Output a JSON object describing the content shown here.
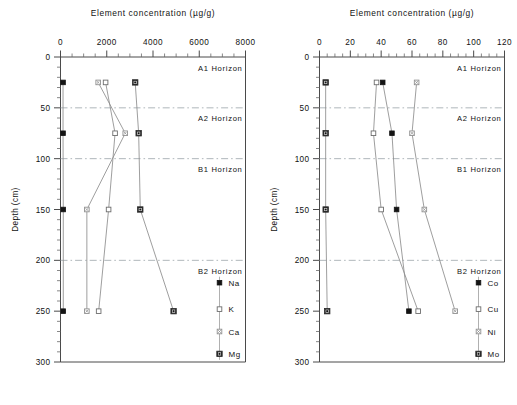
{
  "figure": {
    "panels": [
      {
        "id": "major-elements",
        "axis_title": "Element concentration (µg/g)",
        "x_label": "Element concentration (µg/g)",
        "y_label": "Depth (cm)",
        "x_ticks": [
          "0",
          "2000",
          "4000",
          "6000",
          "8000"
        ],
        "x_tick_values": [
          0,
          2000,
          4000,
          6000,
          8000
        ],
        "x_minor_step": 500,
        "y_ticks": [
          "0",
          "50",
          "100",
          "150",
          "200",
          "250",
          "300"
        ],
        "y_tick_values": [
          0,
          50,
          100,
          150,
          200,
          250,
          300
        ],
        "y_minor_step": 10,
        "xlim": [
          0,
          8000
        ],
        "ylim": [
          0,
          300
        ],
        "horizons": [
          {
            "label": "A1 Horizon",
            "top": 0,
            "bottom": 50,
            "line_at": 50
          },
          {
            "label": "A2 Horizon",
            "top": 50,
            "bottom": 100,
            "line_at": 100
          },
          {
            "label": "B1 Horizon",
            "top": 100,
            "bottom": 200,
            "line_at": 200
          },
          {
            "label": "B2 Horizon",
            "top": 200,
            "bottom": 300,
            "line_at": null
          }
        ],
        "legend": [
          {
            "label": "Na",
            "marker": "filled-square",
            "depth": 222
          },
          {
            "label": "K",
            "marker": "open-square",
            "depth": 248
          },
          {
            "label": "Ca",
            "marker": "dotted-square",
            "depth": 270
          },
          {
            "label": "Mg",
            "marker": "ring-square",
            "depth": 292
          }
        ],
        "series": [
          {
            "name": "Na",
            "marker": "filled-square",
            "depths": [
              25,
              75,
              150,
              250
            ],
            "values": [
              110,
              110,
              120,
              120
            ]
          },
          {
            "name": "K",
            "marker": "open-square",
            "depths": [
              25,
              75,
              150,
              250
            ],
            "values": [
              1950,
              2360,
              2080,
              1650
            ]
          },
          {
            "name": "Ca",
            "marker": "dotted-square",
            "depths": [
              25,
              75,
              150,
              250
            ],
            "values": [
              1630,
              2800,
              1140,
              1140
            ]
          },
          {
            "name": "Mg",
            "marker": "ring-square",
            "depths": [
              25,
              75,
              150,
              250
            ],
            "values": [
              3230,
              3380,
              3450,
              4890
            ]
          }
        ]
      },
      {
        "id": "trace-elements",
        "axis_title": "Element concentration (µg/g)",
        "x_label": "Element concentration (µg/g)",
        "y_label": "Depth (cm)",
        "x_ticks": [
          "0",
          "20",
          "40",
          "60",
          "80",
          "100",
          "120"
        ],
        "x_tick_values": [
          0,
          20,
          40,
          60,
          80,
          100,
          120
        ],
        "x_minor_step": 5,
        "y_ticks": [
          "0",
          "50",
          "100",
          "150",
          "200",
          "250",
          "300"
        ],
        "y_tick_values": [
          0,
          50,
          100,
          150,
          200,
          250,
          300
        ],
        "y_minor_step": 10,
        "xlim": [
          0,
          120
        ],
        "ylim": [
          0,
          300
        ],
        "horizons": [
          {
            "label": "A1 Horizon",
            "top": 0,
            "bottom": 50,
            "line_at": 50
          },
          {
            "label": "A2 Horizon",
            "top": 50,
            "bottom": 100,
            "line_at": 100
          },
          {
            "label": "B1 Horizon",
            "top": 100,
            "bottom": 200,
            "line_at": 200
          },
          {
            "label": "B2 Horizon",
            "top": 200,
            "bottom": 300,
            "line_at": null
          }
        ],
        "legend": [
          {
            "label": "Co",
            "marker": "filled-square",
            "depth": 222
          },
          {
            "label": "Cu",
            "marker": "open-square",
            "depth": 248
          },
          {
            "label": "Ni",
            "marker": "dotted-square",
            "depth": 270
          },
          {
            "label": "Mo",
            "marker": "ring-square",
            "depth": 292
          }
        ],
        "series": [
          {
            "name": "Co",
            "marker": "filled-square",
            "depths": [
              25,
              75,
              150,
              250
            ],
            "values": [
              41,
              47,
              50,
              58
            ]
          },
          {
            "name": "Cu",
            "marker": "open-square",
            "depths": [
              25,
              75,
              150,
              250
            ],
            "values": [
              37,
              35,
              40,
              64
            ]
          },
          {
            "name": "Ni",
            "marker": "dotted-square",
            "depths": [
              25,
              75,
              150,
              250
            ],
            "values": [
              63,
              60,
              68,
              88
            ]
          },
          {
            "name": "Mo",
            "marker": "ring-square",
            "depths": [
              25,
              75,
              150,
              250
            ],
            "values": [
              4,
              4,
              4,
              5
            ]
          }
        ]
      }
    ]
  },
  "chart_data": [
    {
      "type": "line",
      "title": "Element concentration (µg/g)",
      "xlabel": "Element concentration (µg/g)",
      "ylabel": "Depth (cm)",
      "xlim": [
        0,
        8000
      ],
      "ylim": [
        0,
        300
      ],
      "y_inverted": true,
      "grid": false,
      "legend_position": "bottom-right",
      "x": [
        25,
        75,
        150,
        250
      ],
      "x_tick_labels": [
        "0",
        "2000",
        "4000",
        "6000",
        "8000"
      ],
      "y_tick_labels": [
        "0",
        "50",
        "100",
        "150",
        "200",
        "250",
        "300"
      ],
      "annotations": [
        "A1 Horizon",
        "A2 Horizon",
        "B1 Horizon",
        "B2 Horizon"
      ],
      "series": [
        {
          "name": "Na",
          "depths": [
            25,
            75,
            150,
            250
          ],
          "values": [
            110,
            110,
            120,
            120
          ]
        },
        {
          "name": "K",
          "depths": [
            25,
            75,
            150,
            250
          ],
          "values": [
            1950,
            2360,
            2080,
            1650
          ]
        },
        {
          "name": "Ca",
          "depths": [
            25,
            75,
            150,
            250
          ],
          "values": [
            1630,
            2800,
            1140,
            1140
          ]
        },
        {
          "name": "Mg",
          "depths": [
            25,
            75,
            150,
            250
          ],
          "values": [
            3230,
            3380,
            3450,
            4890
          ]
        }
      ]
    },
    {
      "type": "line",
      "title": "Element concentration (µg/g)",
      "xlabel": "Element concentration (µg/g)",
      "ylabel": "Depth (cm)",
      "xlim": [
        0,
        120
      ],
      "ylim": [
        0,
        300
      ],
      "y_inverted": true,
      "grid": false,
      "legend_position": "bottom-right",
      "x": [
        25,
        75,
        150,
        250
      ],
      "x_tick_labels": [
        "0",
        "20",
        "40",
        "60",
        "80",
        "100",
        "120"
      ],
      "y_tick_labels": [
        "0",
        "50",
        "100",
        "150",
        "200",
        "250",
        "300"
      ],
      "annotations": [
        "A1 Horizon",
        "A2 Horizon",
        "B1 Horizon",
        "B2 Horizon"
      ],
      "series": [
        {
          "name": "Co",
          "depths": [
            25,
            75,
            150,
            250
          ],
          "values": [
            41,
            47,
            50,
            58
          ]
        },
        {
          "name": "Cu",
          "depths": [
            25,
            75,
            150,
            250
          ],
          "values": [
            37,
            35,
            40,
            64
          ]
        },
        {
          "name": "Ni",
          "depths": [
            25,
            75,
            150,
            250
          ],
          "values": [
            63,
            60,
            68,
            88
          ]
        },
        {
          "name": "Mo",
          "depths": [
            25,
            75,
            150,
            250
          ],
          "values": [
            4,
            4,
            4,
            5
          ]
        }
      ]
    }
  ]
}
